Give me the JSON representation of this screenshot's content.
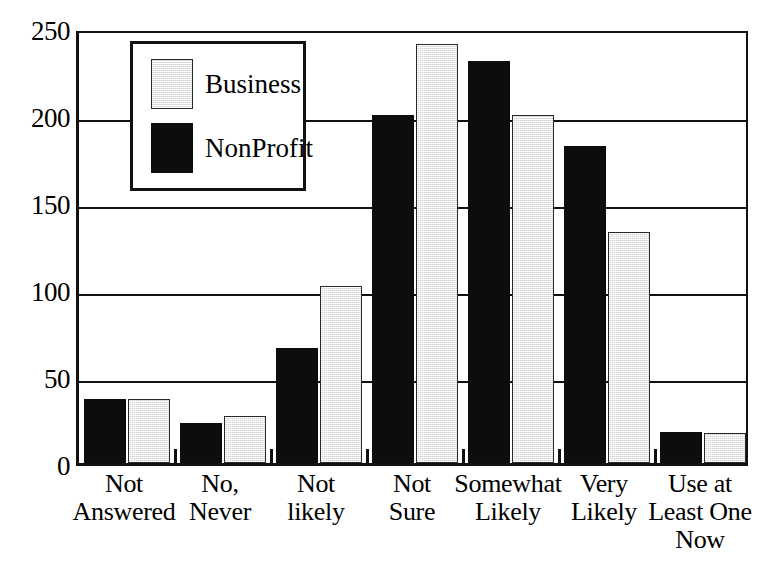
{
  "chart_data": {
    "type": "bar",
    "title": "",
    "subtitle": "",
    "xlabel": "",
    "ylabel": "",
    "ylim": [
      0,
      250
    ],
    "yticks": [
      0,
      50,
      100,
      150,
      200,
      250
    ],
    "grid": "horizontal",
    "legend_position": "top-left-inside",
    "categories": [
      "Not\nAnswered",
      "No,\nNever",
      "Not\nlikely",
      "Not\nSure",
      "Somewhat\nLikely",
      "Very\nLikely",
      "Use at\nLeast One\nNow"
    ],
    "series": [
      {
        "name": "NonProfit",
        "color": "#0d0d0d",
        "fill": "solid-black",
        "values": [
          37,
          23,
          66,
          200,
          231,
          182,
          18
        ]
      },
      {
        "name": "Business",
        "color": "#cfcfcf",
        "fill": "light-stipple",
        "values": [
          37,
          27,
          102,
          241,
          200,
          133,
          17
        ]
      }
    ]
  },
  "axis": {
    "y_tick_labels": [
      "250",
      "200",
      "150",
      "100",
      "50",
      "0"
    ]
  },
  "legend": {
    "entries": [
      {
        "label": "Business",
        "swatch": "business-swatch"
      },
      {
        "label": "NonProfit",
        "swatch": "nonprofit-swatch"
      }
    ]
  }
}
